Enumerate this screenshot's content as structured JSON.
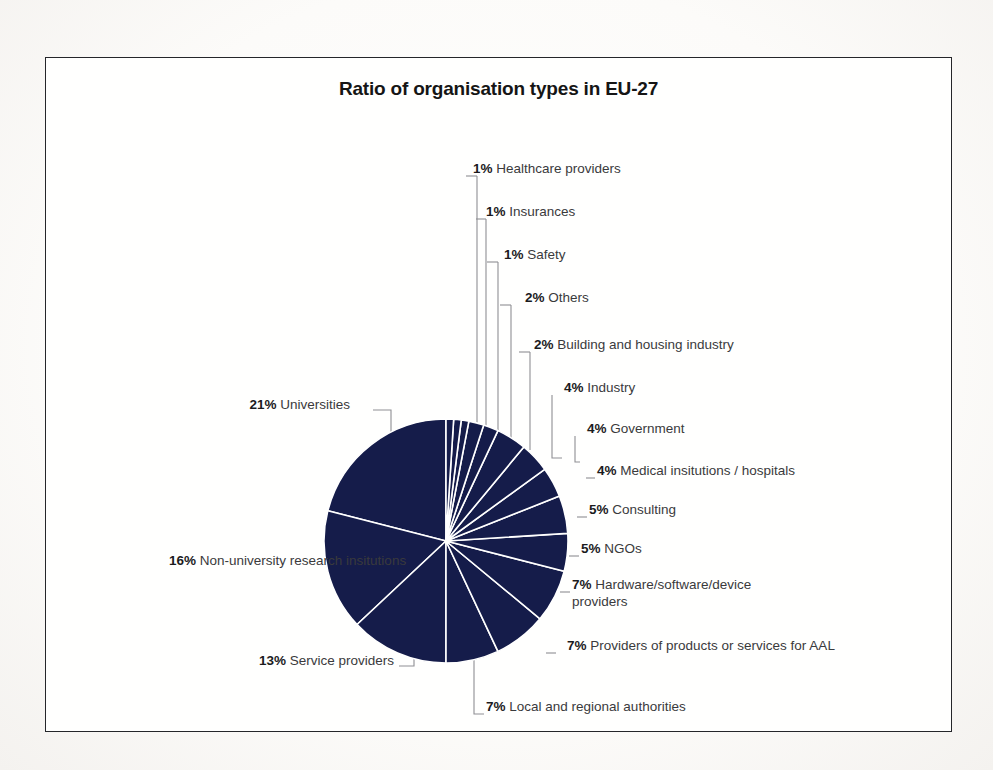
{
  "figure": {
    "title": "Ratio of organisation types in EU-27",
    "frame_color": "#25262a",
    "background_color": "#fffffe"
  },
  "chart_data": {
    "type": "pie",
    "title": "Ratio of organisation types in EU-27",
    "xlabel": "",
    "ylabel": "",
    "unit": "%",
    "total": 100,
    "slice_color": "#151c4a",
    "separator_color": "#ffffff",
    "legend_position": "callout-labels",
    "grid": false,
    "categories": [
      "Universities",
      "Non-university research insitutions",
      "Service providers",
      "Local and regional authorities",
      "Providers of products or services for AAL",
      "Hardware/software/device providers",
      "NGOs",
      "Consulting",
      "Medical insitutions / hospitals",
      "Government",
      "Industry",
      "Building and housing industry",
      "Others",
      "Safety",
      "Insurances",
      "Healthcare providers"
    ],
    "values": [
      21,
      16,
      13,
      7,
      7,
      7,
      5,
      5,
      4,
      4,
      4,
      2,
      2,
      1,
      1,
      1
    ],
    "slices": [
      {
        "label": "Universities",
        "value": 21,
        "percent_text": "21%"
      },
      {
        "label": "Non-university research insitutions",
        "value": 16,
        "percent_text": "16%"
      },
      {
        "label": "Service providers",
        "value": 13,
        "percent_text": "13%"
      },
      {
        "label": "Local and regional authorities",
        "value": 7,
        "percent_text": "7%"
      },
      {
        "label": "Providers of products or services for AAL",
        "value": 7,
        "percent_text": "7%"
      },
      {
        "label": "Hardware/software/device providers",
        "value": 7,
        "percent_text": "7%"
      },
      {
        "label": "NGOs",
        "value": 5,
        "percent_text": "5%"
      },
      {
        "label": "Consulting",
        "value": 5,
        "percent_text": "5%"
      },
      {
        "label": "Medical insitutions / hospitals",
        "value": 4,
        "percent_text": "4%"
      },
      {
        "label": "Government",
        "value": 4,
        "percent_text": "4%"
      },
      {
        "label": "Industry",
        "value": 4,
        "percent_text": "4%"
      },
      {
        "label": "Building and housing industry",
        "value": 2,
        "percent_text": "2%"
      },
      {
        "label": "Others",
        "value": 2,
        "percent_text": "2%"
      },
      {
        "label": "Safety",
        "value": 1,
        "percent_text": "1%"
      },
      {
        "label": "Insurances",
        "value": 1,
        "percent_text": "1%"
      },
      {
        "label": "Healthcare providers",
        "value": 1,
        "percent_text": "1%"
      }
    ]
  },
  "callouts": {
    "healthcare_providers": {
      "pct": "1%",
      "text": "Healthcare providers"
    },
    "insurances": {
      "pct": "1%",
      "text": "Insurances"
    },
    "safety": {
      "pct": "1%",
      "text": "Safety"
    },
    "others": {
      "pct": "2%",
      "text": "Others"
    },
    "building": {
      "pct": "2%",
      "text": "Building and housing industry"
    },
    "industry": {
      "pct": "4%",
      "text": "Industry"
    },
    "government": {
      "pct": "4%",
      "text": "Government"
    },
    "medical": {
      "pct": "4%",
      "text": "Medical insitutions / hospitals"
    },
    "consulting": {
      "pct": "5%",
      "text": "Consulting"
    },
    "ngos": {
      "pct": "5%",
      "text": "NGOs"
    },
    "hardware": {
      "pct": "7%",
      "text": "Hardware/software/device providers"
    },
    "aal": {
      "pct": "7%",
      "text": "Providers of products or services for AAL"
    },
    "local": {
      "pct": "7%",
      "text": "Local and regional authorities"
    },
    "service_providers": {
      "pct": "13%",
      "text": "Service providers"
    },
    "non_university": {
      "pct": "16%",
      "text": "Non-university research insitutions"
    },
    "universities": {
      "pct": "21%",
      "text": "Universities"
    }
  }
}
